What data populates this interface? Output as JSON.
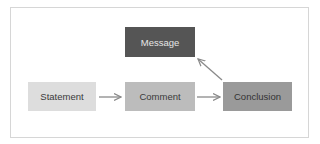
{
  "diagram": {
    "nodes": {
      "message": {
        "label": "Message",
        "fill": "#555555"
      },
      "statement": {
        "label": "Statement",
        "fill": "#dddddd"
      },
      "comment": {
        "label": "Comment",
        "fill": "#bcbcbc"
      },
      "conclusion": {
        "label": "Conclusion",
        "fill": "#9a9a9a"
      }
    },
    "edges": [
      {
        "from": "Statement",
        "to": "Comment"
      },
      {
        "from": "Comment",
        "to": "Conclusion"
      },
      {
        "from": "Conclusion",
        "to": "Message"
      }
    ],
    "arrow_color": "#8a8a8a",
    "frame_border_color": "#d6d6d6"
  }
}
